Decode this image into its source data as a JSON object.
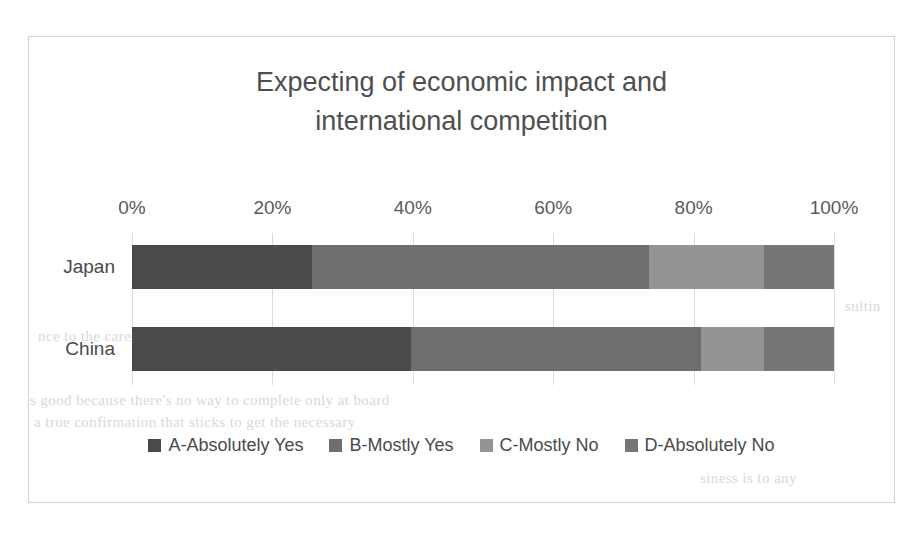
{
  "chart_data": {
    "type": "bar",
    "orientation": "horizontal",
    "stacked": true,
    "normalized": true,
    "title": "Expecting of economic impact and international competition",
    "title_lines": [
      "Expecting of economic impact and",
      "international competition"
    ],
    "xlabel": "",
    "ylabel": "",
    "categories": [
      "Japan",
      "China"
    ],
    "xlim": [
      0,
      100
    ],
    "xticks": [
      0,
      20,
      40,
      60,
      80,
      100
    ],
    "xtick_labels": [
      "0%",
      "20%",
      "40%",
      "60%",
      "80%",
      "100%"
    ],
    "grid": true,
    "grid_axis": "x",
    "legend_position": "bottom",
    "series": [
      {
        "name": "A-Absolutely Yes",
        "color": "#4a4a4a",
        "values": [
          25.6,
          39.7
        ]
      },
      {
        "name": "B-Mostly Yes",
        "color": "#6e6e6e",
        "values": [
          48.0,
          41.3
        ]
      },
      {
        "name": "C-Mostly No",
        "color": "#949494",
        "values": [
          16.4,
          9.0
        ]
      },
      {
        "name": "D-Absolutely No",
        "color": "#767676",
        "values": [
          10.0,
          10.0
        ]
      }
    ]
  },
  "background_text": {
    "line1": "sultin",
    "line2": "nce to the career and AWS engineer. AWS certified. Something to the same",
    "line3": "s good because there's no way to complete only at board",
    "line4": "a true confirmation that sticks to get the necessary",
    "line5": "siness is to any"
  }
}
